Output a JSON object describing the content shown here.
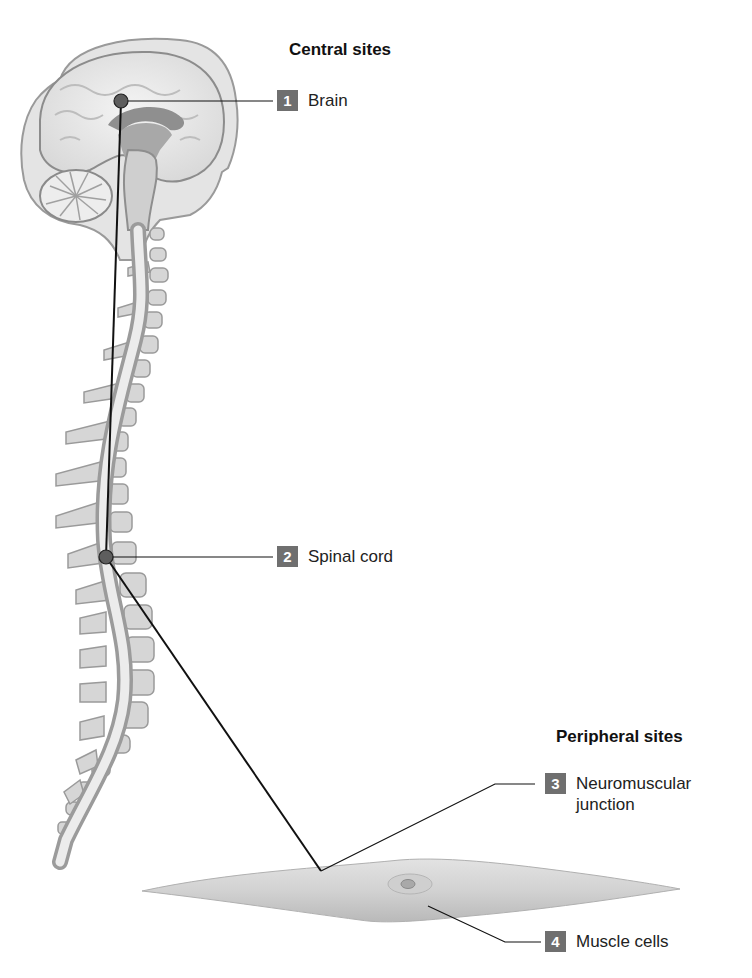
{
  "diagram": {
    "groups": [
      {
        "heading": "Central sites"
      },
      {
        "heading": "Peripheral sites"
      }
    ],
    "labels": [
      {
        "number": "1",
        "text": "Brain"
      },
      {
        "number": "2",
        "text": "Spinal cord"
      },
      {
        "number": "3",
        "text": "Neuromuscular\njunction",
        "line1": "Neuromuscular",
        "line2": "junction"
      },
      {
        "number": "4",
        "text": "Muscle cells"
      }
    ],
    "colors": {
      "badge": "#6f6f6f",
      "leader_line": "#111111",
      "tissue_gray": "#c8c8c8"
    }
  }
}
